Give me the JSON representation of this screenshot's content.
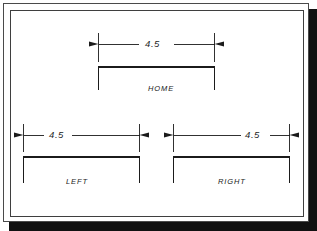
{
  "drawing": {
    "title": "Mechanical dimension drawing sheet",
    "sheet_background": "#ffffff",
    "line_color": "#1b1b1b",
    "frame_color": "#4a4a4a",
    "shadow_color": "#111111",
    "units_note": "",
    "parts": [
      {
        "id": "home",
        "label": "HOME",
        "dimension_value": "4.5",
        "dimension_text_align": "center",
        "profile": "open-bottom-rectangle"
      },
      {
        "id": "left",
        "label": "LEFT",
        "dimension_value": "4.5",
        "dimension_text_align": "left",
        "profile": "open-bottom-rectangle"
      },
      {
        "id": "right",
        "label": "RIGHT",
        "dimension_value": "4.5",
        "dimension_text_align": "right",
        "profile": "open-bottom-rectangle"
      }
    ]
  }
}
